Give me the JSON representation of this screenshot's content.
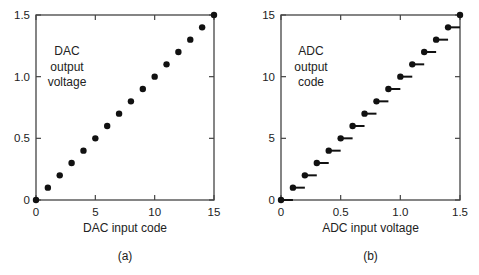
{
  "chart_data": [
    {
      "id": "a",
      "type": "scatter",
      "title": "",
      "caption": "(a)",
      "xlabel": "DAC input code",
      "ylabel": "",
      "inset_label": [
        "DAC",
        "output",
        "voltage"
      ],
      "xlim": [
        0,
        15
      ],
      "ylim": [
        0,
        1.5
      ],
      "xticks": [
        0,
        5,
        10,
        15
      ],
      "xtick_labels": [
        "0",
        "5",
        "10",
        "15"
      ],
      "yticks": [
        0,
        0.5,
        1.0,
        1.5
      ],
      "ytick_labels": [
        "0",
        "0.5",
        "1.0",
        "1.5"
      ],
      "grid": false,
      "legend": null,
      "series": [
        {
          "name": "DAC output voltage",
          "x": [
            0,
            1,
            2,
            3,
            4,
            5,
            6,
            7,
            8,
            9,
            10,
            11,
            12,
            13,
            14,
            15
          ],
          "y": [
            0,
            0.1,
            0.2,
            0.3,
            0.4,
            0.5,
            0.6,
            0.7,
            0.8,
            0.9,
            1.0,
            1.1,
            1.2,
            1.3,
            1.4,
            1.5
          ]
        }
      ]
    },
    {
      "id": "b",
      "type": "line",
      "style": "step (dot at left edge, horizontal segment to next level)",
      "title": "",
      "caption": "(b)",
      "xlabel": "ADC input voltage",
      "ylabel": "",
      "inset_label": [
        "ADC",
        "output",
        "code"
      ],
      "xlim": [
        0,
        1.5
      ],
      "ylim": [
        0,
        15
      ],
      "xticks": [
        0,
        0.5,
        1.0,
        1.5
      ],
      "xtick_labels": [
        "0",
        "0.5",
        "1.0",
        "1.5"
      ],
      "yticks": [
        0,
        5,
        10,
        15
      ],
      "ytick_labels": [
        "0",
        "5",
        "10",
        "15"
      ],
      "grid": false,
      "legend": null,
      "series": [
        {
          "name": "ADC output code",
          "x": [
            0,
            0.1,
            0.2,
            0.3,
            0.4,
            0.5,
            0.6,
            0.7,
            0.8,
            0.9,
            1.0,
            1.1,
            1.2,
            1.3,
            1.4,
            1.5
          ],
          "y": [
            0,
            1,
            2,
            3,
            4,
            5,
            6,
            7,
            8,
            9,
            10,
            11,
            12,
            13,
            14,
            15
          ],
          "step_width": 0.1
        }
      ]
    }
  ],
  "colors": {
    "marker": "#111111",
    "frame": "#444444",
    "text": "#222222"
  }
}
